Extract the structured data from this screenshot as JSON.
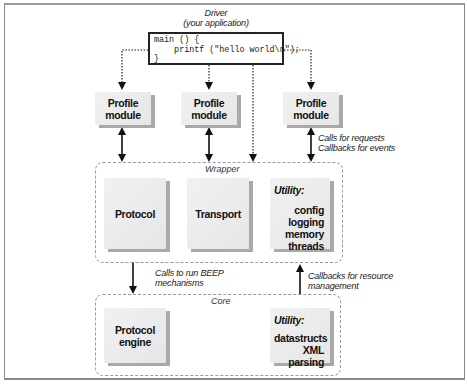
{
  "driver": {
    "title_line1": "Driver",
    "title_line2": "(your application)",
    "code": "main () {\n    printf (\"hello world\\n\");\n}"
  },
  "profile_modules": [
    {
      "label": "Profile\nmodule"
    },
    {
      "label": "Profile\nmodule"
    },
    {
      "label": "Profile\nmodule"
    }
  ],
  "annotations": {
    "profile_to_wrapper": "Calls for requests\nCallbacks for events",
    "wrapper_to_core": "Calls to run BEEP\nmechanisms",
    "core_to_wrapper": "Callbacks for resource\nmanagement"
  },
  "wrapper": {
    "label": "Wrapper",
    "protocol": "Protocol",
    "transport": "Transport",
    "utility": {
      "title": "Utility:",
      "items": [
        "config",
        "logging",
        "memory",
        "threads"
      ]
    }
  },
  "core": {
    "label": "Core",
    "protocol_engine": "Protocol\nengine",
    "utility": {
      "title": "Utility:",
      "items": [
        "datastructs",
        "XML parsing"
      ]
    }
  },
  "colors": {
    "block_fill": "#ececec",
    "block_shadow": "#a9a9a9",
    "dashed_border": "#9a9a9a",
    "line": "#222222"
  }
}
